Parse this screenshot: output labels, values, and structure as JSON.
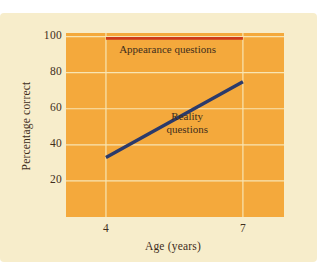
{
  "page": {
    "background": "#ffffff"
  },
  "card": {
    "background": "#f7edcb"
  },
  "chart_data": {
    "type": "line",
    "title": "",
    "xlabel": "Age (years)",
    "ylabel": "Percentage correct",
    "x_ticks": [
      "4",
      "7"
    ],
    "y_ticks": [
      "20",
      "40",
      "60",
      "80",
      "100"
    ],
    "xlim": [
      3.125,
      7.9
    ],
    "ylim": [
      0,
      102
    ],
    "grid": true,
    "grid_color": "#f8e5b2",
    "plot_background": "#f4a93c",
    "text_color": "#3f2e1c",
    "legend_position": "in-plot annotations",
    "series": [
      {
        "name": "Appearance questions",
        "color": "#ce3a1a",
        "x": [
          4,
          7
        ],
        "values": [
          99,
          99
        ],
        "stroke_width": 2.6
      },
      {
        "name": "Reality questions",
        "color": "#2b3a6b",
        "x": [
          4,
          7
        ],
        "values": [
          33,
          75
        ],
        "stroke_width": 3.4
      }
    ],
    "annotations": [
      {
        "lines": [
          "Appearance questions"
        ],
        "x": 5.35,
        "y": 93
      },
      {
        "lines": [
          "Reality",
          "questions"
        ],
        "x": 5.78,
        "y": 52
      }
    ]
  }
}
